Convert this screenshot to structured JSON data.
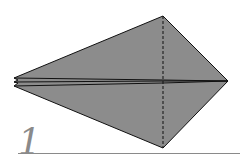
{
  "diagram": {
    "type": "origami-fold-step",
    "step_number": "1",
    "colors": {
      "paper_fill": "#8c8c8c",
      "outline": "#111111",
      "step_number": "#8a8a8a",
      "rule": "#8a8a8a"
    },
    "shape": {
      "top_vertex": [
        163,
        16
      ],
      "right_vertex": [
        228,
        81
      ],
      "bottom_vertex": [
        163,
        148
      ],
      "left_tips": [
        [
          14,
          78
        ],
        [
          14,
          82
        ],
        [
          14,
          86
        ]
      ]
    },
    "valley_fold_line": {
      "x": 163,
      "y1": 16,
      "y2": 148,
      "style": "dashed"
    }
  }
}
